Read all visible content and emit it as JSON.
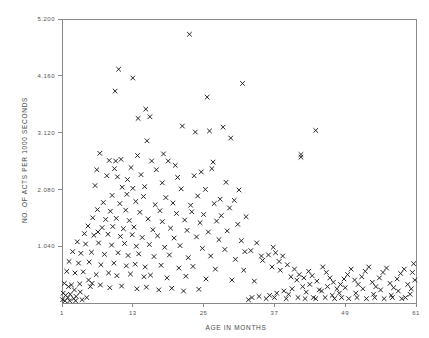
{
  "chart_data": {
    "type": "scatter",
    "title": "",
    "xlabel": "AGE IN MONTHS",
    "ylabel": "NO. OF ACTS PER 1000 SECONDS",
    "marker": "x",
    "grid": false,
    "legend": null,
    "xlim": [
      1,
      61
    ],
    "ylim": [
      0,
      5.2
    ],
    "xticks": [
      1,
      13,
      25,
      37,
      49,
      61
    ],
    "xtick_labels": [
      "1",
      "13",
      "25",
      "37",
      "49",
      "61"
    ],
    "yticks": [
      1.04,
      2.08,
      3.12,
      4.16,
      5.2
    ],
    "ytick_labels": [
      "1.040",
      "2.080",
      "3.120",
      "4.160",
      "5.200"
    ],
    "points": [
      [
        22.6,
        4.92
      ],
      [
        10.6,
        4.28
      ],
      [
        13.0,
        4.12
      ],
      [
        10.0,
        3.88
      ],
      [
        31.6,
        4.02
      ],
      [
        25.6,
        3.77
      ],
      [
        15.2,
        3.55
      ],
      [
        13.9,
        3.38
      ],
      [
        15.9,
        3.41
      ],
      [
        21.4,
        3.24
      ],
      [
        28.3,
        3.22
      ],
      [
        44.0,
        3.16
      ],
      [
        23.6,
        3.13
      ],
      [
        26.0,
        3.15
      ],
      [
        15.4,
        2.97
      ],
      [
        29.6,
        3.02
      ],
      [
        7.4,
        2.74
      ],
      [
        13.8,
        2.7
      ],
      [
        18.2,
        2.73
      ],
      [
        41.5,
        2.72
      ],
      [
        41.5,
        2.67
      ],
      [
        9.0,
        2.61
      ],
      [
        11.0,
        2.63
      ],
      [
        10.1,
        2.6
      ],
      [
        16.2,
        2.6
      ],
      [
        19.0,
        2.6
      ],
      [
        6.9,
        2.44
      ],
      [
        9.9,
        2.46
      ],
      [
        12.7,
        2.48
      ],
      [
        17.0,
        2.44
      ],
      [
        26.4,
        2.46
      ],
      [
        8.6,
        2.33
      ],
      [
        10.4,
        2.31
      ],
      [
        14.4,
        2.35
      ],
      [
        20.6,
        2.3
      ],
      [
        23.4,
        2.33
      ],
      [
        28.8,
        2.21
      ],
      [
        6.6,
        2.15
      ],
      [
        11.2,
        2.12
      ],
      [
        13.0,
        2.1
      ],
      [
        15.0,
        2.13
      ],
      [
        21.2,
        2.09
      ],
      [
        25.3,
        2.08
      ],
      [
        31.0,
        2.07
      ],
      [
        9.5,
        1.97
      ],
      [
        12.0,
        1.99
      ],
      [
        14.8,
        1.95
      ],
      [
        18.6,
        1.93
      ],
      [
        24.0,
        1.96
      ],
      [
        27.8,
        1.9
      ],
      [
        30.2,
        1.88
      ],
      [
        8.0,
        1.84
      ],
      [
        10.8,
        1.82
      ],
      [
        13.5,
        1.86
      ],
      [
        16.8,
        1.8
      ],
      [
        19.8,
        1.83
      ],
      [
        22.8,
        1.79
      ],
      [
        26.8,
        1.82
      ],
      [
        29.4,
        1.74
      ],
      [
        7.0,
        1.71
      ],
      [
        9.2,
        1.68
      ],
      [
        11.8,
        1.7
      ],
      [
        14.2,
        1.66
      ],
      [
        17.6,
        1.69
      ],
      [
        20.4,
        1.64
      ],
      [
        23.0,
        1.67
      ],
      [
        25.0,
        1.62
      ],
      [
        28.0,
        1.6
      ],
      [
        32.2,
        1.58
      ],
      [
        6.2,
        1.56
      ],
      [
        8.4,
        1.53
      ],
      [
        10.2,
        1.55
      ],
      [
        12.4,
        1.51
      ],
      [
        15.6,
        1.54
      ],
      [
        18.0,
        1.49
      ],
      [
        21.8,
        1.52
      ],
      [
        24.4,
        1.47
      ],
      [
        27.2,
        1.5
      ],
      [
        30.8,
        1.44
      ],
      [
        5.4,
        1.41
      ],
      [
        7.8,
        1.38
      ],
      [
        9.6,
        1.4
      ],
      [
        11.4,
        1.36
      ],
      [
        13.2,
        1.39
      ],
      [
        16.4,
        1.34
      ],
      [
        19.4,
        1.37
      ],
      [
        22.2,
        1.33
      ],
      [
        25.8,
        1.3
      ],
      [
        29.0,
        1.32
      ],
      [
        4.8,
        1.27
      ],
      [
        6.4,
        1.24
      ],
      [
        8.8,
        1.26
      ],
      [
        10.9,
        1.22
      ],
      [
        12.9,
        1.25
      ],
      [
        14.6,
        1.2
      ],
      [
        17.2,
        1.23
      ],
      [
        20.0,
        1.19
      ],
      [
        23.8,
        1.21
      ],
      [
        27.6,
        1.16
      ],
      [
        31.4,
        1.14
      ],
      [
        34.0,
        1.1
      ],
      [
        3.6,
        1.12
      ],
      [
        5.0,
        1.08
      ],
      [
        7.2,
        1.1
      ],
      [
        9.4,
        1.06
      ],
      [
        11.6,
        1.09
      ],
      [
        13.6,
        1.04
      ],
      [
        15.8,
        1.07
      ],
      [
        18.4,
        1.02
      ],
      [
        21.0,
        1.05
      ],
      [
        24.8,
        1.0
      ],
      [
        28.6,
        0.98
      ],
      [
        33.0,
        0.96
      ],
      [
        2.8,
        0.94
      ],
      [
        4.2,
        0.91
      ],
      [
        6.0,
        0.93
      ],
      [
        8.2,
        0.89
      ],
      [
        10.5,
        0.92
      ],
      [
        12.2,
        0.87
      ],
      [
        14.0,
        0.9
      ],
      [
        16.6,
        0.85
      ],
      [
        19.2,
        0.88
      ],
      [
        22.4,
        0.83
      ],
      [
        26.2,
        0.86
      ],
      [
        30.4,
        0.8
      ],
      [
        35.0,
        0.78
      ],
      [
        2.2,
        0.76
      ],
      [
        3.8,
        0.73
      ],
      [
        5.6,
        0.75
      ],
      [
        7.6,
        0.7
      ],
      [
        9.8,
        0.73
      ],
      [
        11.9,
        0.68
      ],
      [
        13.4,
        0.71
      ],
      [
        15.1,
        0.66
      ],
      [
        17.8,
        0.69
      ],
      [
        20.8,
        0.64
      ],
      [
        23.2,
        0.67
      ],
      [
        27.0,
        0.62
      ],
      [
        31.8,
        0.6
      ],
      [
        1.8,
        0.58
      ],
      [
        3.2,
        0.55
      ],
      [
        4.6,
        0.57
      ],
      [
        6.8,
        0.52
      ],
      [
        8.9,
        0.55
      ],
      [
        10.3,
        0.5
      ],
      [
        12.6,
        0.53
      ],
      [
        14.9,
        0.48
      ],
      [
        16.0,
        0.51
      ],
      [
        18.8,
        0.46
      ],
      [
        22.0,
        0.49
      ],
      [
        25.4,
        0.44
      ],
      [
        29.8,
        0.42
      ],
      [
        33.6,
        0.4
      ],
      [
        1.4,
        0.36
      ],
      [
        2.6,
        0.33
      ],
      [
        4.0,
        0.35
      ],
      [
        5.8,
        0.3
      ],
      [
        7.5,
        0.33
      ],
      [
        9.1,
        0.28
      ],
      [
        11.1,
        0.31
      ],
      [
        13.7,
        0.26
      ],
      [
        15.3,
        0.29
      ],
      [
        17.4,
        0.24
      ],
      [
        19.6,
        0.27
      ],
      [
        21.6,
        0.22
      ],
      [
        24.2,
        0.25
      ],
      [
        1.2,
        0.18
      ],
      [
        1.6,
        0.14
      ],
      [
        2.0,
        0.1
      ],
      [
        2.4,
        0.16
      ],
      [
        3.0,
        0.08
      ],
      [
        3.4,
        0.12
      ],
      [
        4.4,
        0.06
      ],
      [
        5.2,
        0.1
      ],
      [
        36.0,
        0.88
      ],
      [
        37.2,
        0.92
      ],
      [
        38.4,
        0.86
      ],
      [
        37.8,
        0.76
      ],
      [
        36.6,
        0.66
      ],
      [
        38.0,
        0.6
      ],
      [
        39.2,
        0.7
      ],
      [
        40.4,
        0.62
      ],
      [
        39.8,
        0.48
      ],
      [
        40.8,
        0.42
      ],
      [
        41.2,
        0.52
      ],
      [
        42.0,
        0.46
      ],
      [
        42.8,
        0.58
      ],
      [
        43.4,
        0.5
      ],
      [
        44.2,
        0.4
      ],
      [
        43.0,
        0.34
      ],
      [
        41.8,
        0.3
      ],
      [
        40.0,
        0.26
      ],
      [
        38.6,
        0.22
      ],
      [
        37.4,
        0.18
      ],
      [
        36.2,
        0.14
      ],
      [
        39.4,
        0.16
      ],
      [
        42.4,
        0.2
      ],
      [
        44.6,
        0.24
      ],
      [
        45.2,
        0.66
      ],
      [
        45.8,
        0.56
      ],
      [
        46.4,
        0.46
      ],
      [
        47.0,
        0.38
      ],
      [
        46.0,
        0.3
      ],
      [
        45.0,
        0.22
      ],
      [
        47.6,
        0.26
      ],
      [
        48.2,
        0.34
      ],
      [
        48.8,
        0.44
      ],
      [
        49.4,
        0.52
      ],
      [
        50.0,
        0.62
      ],
      [
        49.0,
        0.28
      ],
      [
        48.0,
        0.18
      ],
      [
        46.8,
        0.14
      ],
      [
        50.6,
        0.42
      ],
      [
        51.2,
        0.34
      ],
      [
        51.8,
        0.48
      ],
      [
        52.4,
        0.58
      ],
      [
        53.0,
        0.66
      ],
      [
        52.0,
        0.26
      ],
      [
        50.8,
        0.18
      ],
      [
        53.6,
        0.38
      ],
      [
        54.2,
        0.3
      ],
      [
        54.8,
        0.46
      ],
      [
        55.4,
        0.56
      ],
      [
        56.0,
        0.64
      ],
      [
        55.0,
        0.24
      ],
      [
        53.8,
        0.16
      ],
      [
        56.6,
        0.36
      ],
      [
        57.2,
        0.28
      ],
      [
        57.8,
        0.44
      ],
      [
        58.4,
        0.54
      ],
      [
        59.0,
        0.62
      ],
      [
        58.0,
        0.22
      ],
      [
        56.8,
        0.14
      ],
      [
        59.6,
        0.34
      ],
      [
        60.2,
        0.26
      ],
      [
        60.8,
        0.42
      ],
      [
        60.0,
        0.16
      ],
      [
        59.2,
        0.1
      ],
      [
        58.6,
        0.08
      ],
      [
        57.0,
        0.1
      ],
      [
        55.6,
        0.08
      ],
      [
        54.0,
        0.1
      ],
      [
        52.6,
        0.08
      ],
      [
        51.0,
        0.1
      ],
      [
        49.6,
        0.08
      ],
      [
        48.4,
        0.1
      ],
      [
        47.2,
        0.08
      ],
      [
        45.6,
        0.1
      ],
      [
        44.0,
        0.08
      ],
      [
        43.6,
        0.1
      ],
      [
        42.2,
        0.08
      ],
      [
        41.0,
        0.1
      ],
      [
        39.0,
        0.08
      ],
      [
        37.0,
        0.1
      ],
      [
        35.6,
        0.08
      ],
      [
        34.4,
        0.12
      ],
      [
        33.2,
        0.1
      ],
      [
        32.6,
        0.06
      ],
      [
        60.6,
        0.72
      ],
      [
        60.4,
        0.56
      ],
      [
        34.8,
        0.86
      ],
      [
        32.0,
        0.94
      ],
      [
        36.8,
        1.02
      ],
      [
        26.6,
        2.58
      ],
      [
        24.6,
        2.4
      ],
      [
        20.2,
        2.52
      ],
      [
        18.0,
        2.2
      ],
      [
        12.1,
        2.26
      ],
      [
        7.1,
        1.3
      ],
      [
        5.5,
        0.42
      ],
      [
        4.1,
        0.2
      ],
      [
        2.1,
        0.3
      ],
      [
        3.1,
        0.24
      ],
      [
        6.1,
        0.36
      ],
      [
        1.1,
        0.06
      ],
      [
        1.5,
        0.04
      ],
      [
        2.3,
        0.04
      ],
      [
        3.3,
        0.04
      ]
    ]
  }
}
